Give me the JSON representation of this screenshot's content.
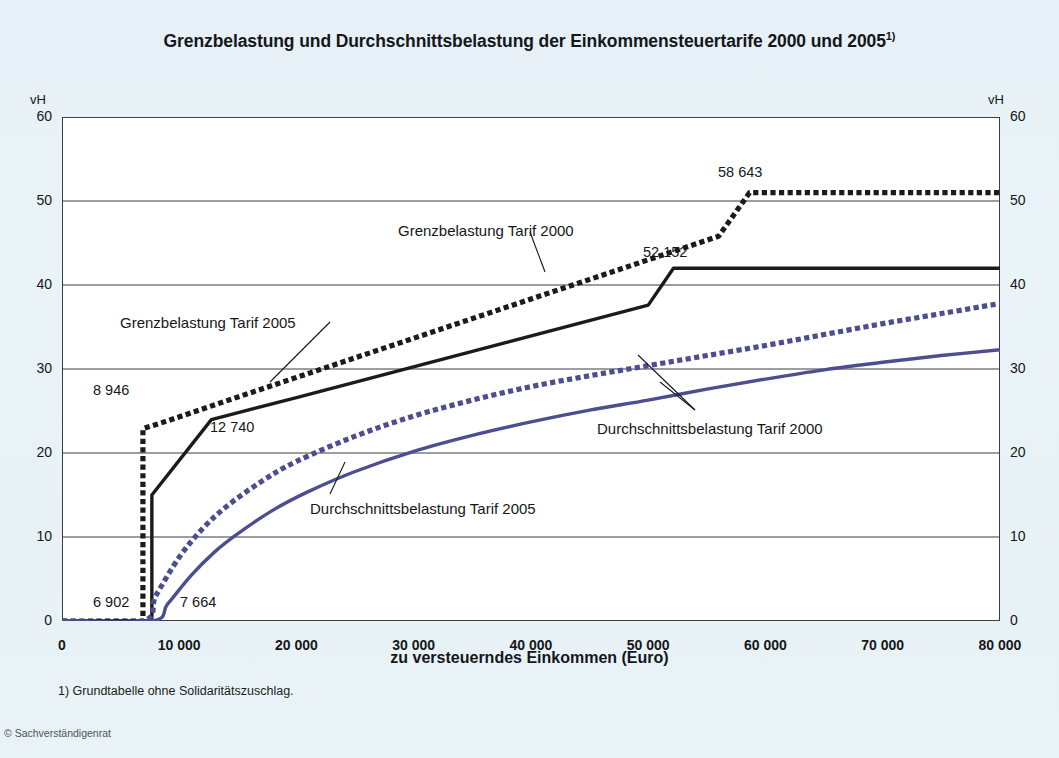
{
  "title": "Grenzbelastung und Durchschnittsbelastung der Einkommensteuertarife 2000 und 2005",
  "title_footnote_marker": "1)",
  "axis": {
    "y_unit_left": "vH",
    "y_unit_right": "vH",
    "x_label": "zu versteuerndes Einkommen (Euro)",
    "y_ticks": [
      "0",
      "10",
      "20",
      "30",
      "40",
      "50",
      "60"
    ],
    "x_ticks": [
      "0",
      "10 000",
      "20 000",
      "30 000",
      "40 000",
      "50 000",
      "60 000",
      "70 000",
      "80 000"
    ]
  },
  "callouts": [
    {
      "id": "grenz2000",
      "text": "Grenzbelastung Tarif 2000"
    },
    {
      "id": "grenz2005",
      "text": "Grenzbelastung Tarif 2005"
    },
    {
      "id": "durch2000",
      "text": "Durchschnittsbelastung Tarif 2000"
    },
    {
      "id": "durch2005",
      "text": "Durchschnittsbelastung Tarif 2005"
    }
  ],
  "value_labels": [
    {
      "id": "v6902",
      "text": "6 902"
    },
    {
      "id": "v7664",
      "text": "7 664"
    },
    {
      "id": "v8946",
      "text": "8 946"
    },
    {
      "id": "v12740",
      "text": "12 740"
    },
    {
      "id": "v52152",
      "text": "52 152"
    },
    {
      "id": "v58643",
      "text": "58 643"
    }
  ],
  "footnote": "1) Grundtabelle ohne Solidaritätszuschlag.",
  "copyright": "© Sachverständigenrat",
  "colors": {
    "marginal": "#1b1b1b",
    "average": "#4d4d92",
    "background": "#e9f2f7",
    "plot_background": "#ffffff",
    "grid": "#3a3d42"
  },
  "chart_data": {
    "type": "line",
    "title": "Grenzbelastung und Durchschnittsbelastung der Einkommensteuertarife 2000 und 2005",
    "xlabel": "zu versteuerndes Einkommen (Euro)",
    "ylabel": "vH",
    "xlim": [
      0,
      80000
    ],
    "ylim": [
      0,
      60
    ],
    "xticks": [
      0,
      10000,
      20000,
      30000,
      40000,
      50000,
      60000,
      70000,
      80000
    ],
    "yticks": [
      0,
      10,
      20,
      30,
      40,
      50,
      60
    ],
    "grid": "horizontal",
    "legend": "inline-annotations",
    "annotations": [
      {
        "value": 6902,
        "label": "6 902",
        "series": "Grenzbelastung Tarif 2000",
        "note": "Grundfreibetrag 2000 - Tarifsprung auf 22,9 vH"
      },
      {
        "value": 7664,
        "label": "7 664",
        "series": "Durchschnittsbelastung Tarif 2005",
        "note": "Grundfreibetrag 2005"
      },
      {
        "value": 8946,
        "label": "8 946",
        "series": "Grenzbelastung Tarif 2000",
        "note": "Ende der unteren Progressionszone"
      },
      {
        "value": 12740,
        "label": "12 740",
        "series": "Grenzbelastung Tarif 2005",
        "note": "Knick der Progressionszone"
      },
      {
        "value": 52152,
        "label": "52 152",
        "series": "Grenzbelastung Tarif 2005",
        "note": "Beginn Spitzensteuersatz 42 vH"
      },
      {
        "value": 58643,
        "label": "58 643",
        "series": "Grenzbelastung Tarif 2000",
        "note": "Beginn Spitzensteuersatz 51 vH"
      }
    ],
    "series": [
      {
        "name": "Grenzbelastung Tarif 2000",
        "style": "dotted",
        "color": "#1b1b1b",
        "points": [
          [
            0,
            0
          ],
          [
            6902,
            0
          ],
          [
            6902,
            22.9
          ],
          [
            8946,
            23.8
          ],
          [
            14000,
            26.2
          ],
          [
            20000,
            29.0
          ],
          [
            26000,
            31.8
          ],
          [
            32000,
            34.6
          ],
          [
            38000,
            37.4
          ],
          [
            44000,
            40.2
          ],
          [
            50000,
            43.0
          ],
          [
            56000,
            45.8
          ],
          [
            58643,
            51.0
          ],
          [
            65000,
            51.0
          ],
          [
            72000,
            51.0
          ],
          [
            80000,
            51.0
          ]
        ]
      },
      {
        "name": "Grenzbelastung Tarif 2005",
        "style": "solid",
        "color": "#1b1b1b",
        "points": [
          [
            0,
            0
          ],
          [
            7664,
            0
          ],
          [
            7664,
            15.0
          ],
          [
            12740,
            23.97
          ],
          [
            20000,
            26.6
          ],
          [
            26000,
            28.8
          ],
          [
            32000,
            31.0
          ],
          [
            38000,
            33.2
          ],
          [
            44000,
            35.4
          ],
          [
            50000,
            37.6
          ],
          [
            52152,
            42.0
          ],
          [
            60000,
            42.0
          ],
          [
            70000,
            42.0
          ],
          [
            80000,
            42.0
          ]
        ]
      },
      {
        "name": "Durchschnittsbelastung Tarif 2000",
        "style": "dotted",
        "color": "#4d4d92",
        "points": [
          [
            0,
            0
          ],
          [
            6902,
            0
          ],
          [
            8000,
            3.0
          ],
          [
            10000,
            7.6
          ],
          [
            12000,
            11.0
          ],
          [
            14000,
            13.6
          ],
          [
            17000,
            16.6
          ],
          [
            20000,
            19.0
          ],
          [
            25000,
            22.0
          ],
          [
            30000,
            24.4
          ],
          [
            35000,
            26.3
          ],
          [
            40000,
            27.9
          ],
          [
            45000,
            29.2
          ],
          [
            50000,
            30.4
          ],
          [
            55000,
            31.6
          ],
          [
            60000,
            32.8
          ],
          [
            65000,
            34.1
          ],
          [
            70000,
            35.4
          ],
          [
            75000,
            36.6
          ],
          [
            80000,
            37.8
          ]
        ]
      },
      {
        "name": "Durchschnittsbelastung Tarif 2005",
        "style": "solid",
        "color": "#4d4d92",
        "points": [
          [
            0,
            0
          ],
          [
            7664,
            0
          ],
          [
            9000,
            2.0
          ],
          [
            11000,
            5.4
          ],
          [
            13000,
            8.2
          ],
          [
            15000,
            10.4
          ],
          [
            18000,
            13.2
          ],
          [
            21000,
            15.4
          ],
          [
            25000,
            17.8
          ],
          [
            30000,
            20.2
          ],
          [
            35000,
            22.1
          ],
          [
            40000,
            23.7
          ],
          [
            45000,
            25.1
          ],
          [
            50000,
            26.3
          ],
          [
            55000,
            27.6
          ],
          [
            60000,
            28.8
          ],
          [
            65000,
            29.9
          ],
          [
            70000,
            30.8
          ],
          [
            75000,
            31.6
          ],
          [
            80000,
            32.3
          ]
        ]
      }
    ]
  }
}
